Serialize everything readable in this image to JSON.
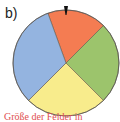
{
  "figure": {
    "label": "b)",
    "caption": "Größe der Felder in"
  },
  "wheel": {
    "center": [
      66,
      63
    ],
    "radius": 53,
    "pointer_color": "#111111",
    "outline_color": "#555555",
    "sectors": [
      {
        "name": "red",
        "color": "#f47c52",
        "start_deg": -20,
        "end_deg": 45
      },
      {
        "name": "green",
        "color": "#9cc46c",
        "start_deg": 45,
        "end_deg": 135
      },
      {
        "name": "yellow",
        "color": "#f8ec8c",
        "start_deg": 135,
        "end_deg": 225
      },
      {
        "name": "blue",
        "color": "#94b4e0",
        "start_deg": 225,
        "end_deg": 340
      }
    ]
  },
  "chart_data": {
    "type": "pie",
    "title": "b)",
    "categories": [
      "red",
      "green",
      "yellow",
      "blue"
    ],
    "values": [
      65,
      90,
      90,
      115
    ],
    "unit": "degrees",
    "annotations": [
      "pointer at top (0°)"
    ]
  }
}
